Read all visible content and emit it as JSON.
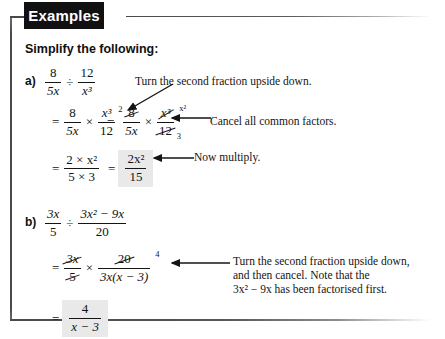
{
  "header": {
    "tab_label": "Examples"
  },
  "instruction": "Simplify the following:",
  "parts": [
    {
      "label": "a)",
      "problem": {
        "left": {
          "num": "8",
          "den": "5x"
        },
        "operator": "÷",
        "right": {
          "num": "12",
          "den": "x³"
        }
      },
      "steps": [
        {
          "text": "= 8/5x × x³/12 = 8/5x × x³/12",
          "first_num": "8",
          "first_den": "5x",
          "second_num": "x³",
          "second_den": "12",
          "cancel_top": "2",
          "cancel_bottom": "3",
          "cancel_exp": "x²"
        },
        {
          "num": "2 × x²",
          "den": "5 × 3",
          "answer_num": "2x²",
          "answer_den": "15"
        }
      ],
      "notes": [
        "Turn the second fraction upside down.",
        "Cancel all common factors.",
        "Now multiply."
      ]
    },
    {
      "label": "b)",
      "problem": {
        "left": {
          "num": "3x",
          "den": "5"
        },
        "operator": "÷",
        "right": {
          "num": "3x² − 9x",
          "den": "20"
        }
      },
      "steps": [
        {
          "first_num": "3x",
          "first_den": "5",
          "second_num": "20",
          "second_den": "3x(x − 3)",
          "cancel_exp": "4"
        },
        {
          "answer_num": "4",
          "answer_den": "x − 3"
        }
      ],
      "notes": [
        "Turn the second fraction upside down,",
        "and then cancel.  Note that the",
        "3x² − 9x has been factorised first."
      ]
    }
  ],
  "symbols": {
    "equals": "=",
    "times": "×",
    "divide": "÷",
    "minus": "−"
  },
  "colors": {
    "tab_background": "#111111",
    "tab_text": "#ffffff",
    "rule": "#4a4a4a",
    "answer_highlight": "#e9e9e9",
    "text": "#141414"
  }
}
